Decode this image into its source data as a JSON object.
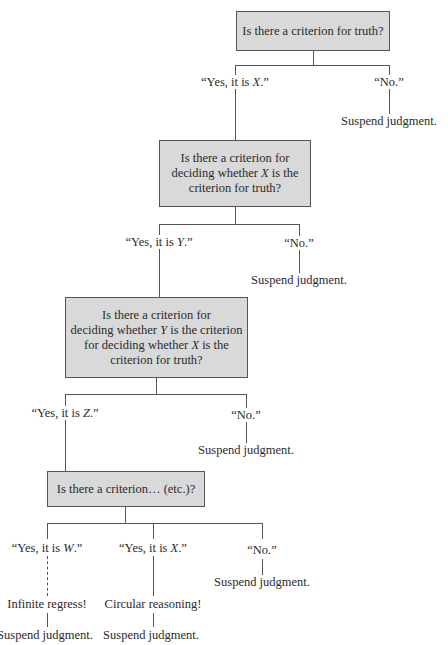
{
  "diagram": {
    "type": "decision-tree",
    "nodes": {
      "q1": {
        "text": "Is there a criterion for truth?"
      },
      "q2": {
        "line1": "Is there a criterion for",
        "line2_pre": "deciding whether ",
        "line2_var": "X",
        "line2_post": " is the",
        "line3": "criterion for truth?"
      },
      "q3": {
        "line1": "Is there a criterion for",
        "line2_pre": "deciding whether ",
        "line2_var": "Y",
        "line2_post": " is the criterion",
        "line3_pre": "for deciding whether ",
        "line3_var": "X",
        "line3_post": " is the",
        "line4": "criterion for truth?"
      },
      "q4": {
        "text": "Is there a criterion… (etc.)?"
      }
    },
    "answers": {
      "q1_yes": {
        "pre": "“Yes, it is ",
        "var": "X",
        "post": ".”"
      },
      "q1_no": {
        "text": "“No.”",
        "outcome": "Suspend judgment."
      },
      "q2_yes": {
        "pre": "“Yes, it is ",
        "var": "Y",
        "post": ".”"
      },
      "q2_no": {
        "text": "“No.”",
        "outcome": "Suspend judgment."
      },
      "q3_yes": {
        "pre": "“Yes, it is ",
        "var": "Z",
        "post": ".”"
      },
      "q3_no": {
        "text": "“No.”",
        "outcome": "Suspend judgment."
      },
      "q4_yes_w": {
        "pre": "“Yes, it is ",
        "var": "W",
        "post": ".”",
        "result": "Infinite regress!",
        "outcome": "Suspend judgment."
      },
      "q4_yes_x": {
        "pre": "“Yes, it is ",
        "var": "X",
        "post": ".”",
        "result": "Circular reasoning!",
        "outcome": "Suspend judgment."
      },
      "q4_no": {
        "text": "“No.”",
        "outcome": "Suspend judgment."
      }
    },
    "colors": {
      "box_fill": "#d9d9d9",
      "box_border": "#555555",
      "line": "#555555",
      "text": "#2a2a2a"
    }
  }
}
